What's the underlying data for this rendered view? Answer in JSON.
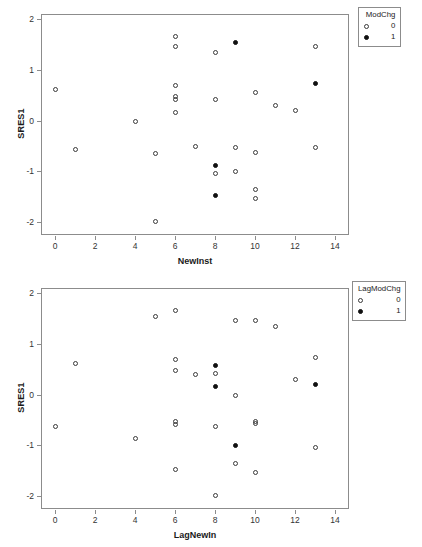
{
  "chart_data": [
    {
      "type": "scatter",
      "title": "",
      "xlabel": "NewInst",
      "ylabel": "SRES1",
      "xlim": [
        -0.7,
        14.7
      ],
      "ylim": [
        -2.25,
        2.1
      ],
      "xticks": [
        0,
        2,
        4,
        6,
        8,
        10,
        12,
        14
      ],
      "yticks": [
        -2,
        -1,
        0,
        1,
        2
      ],
      "grid": false,
      "legend": {
        "title": "ModChg",
        "position": "top-right",
        "entries": [
          {
            "label": "0",
            "marker": "open-circle"
          },
          {
            "label": "1",
            "marker": "filled-circle"
          }
        ]
      },
      "series": [
        {
          "name": "0",
          "marker": "open-circle",
          "points": [
            {
              "x": 0,
              "y": 0.61
            },
            {
              "x": 1,
              "y": -0.56
            },
            {
              "x": 4,
              "y": -0.01
            },
            {
              "x": 5,
              "y": -0.64
            },
            {
              "x": 5,
              "y": -1.99
            },
            {
              "x": 6,
              "y": 1.66
            },
            {
              "x": 6,
              "y": 1.47
            },
            {
              "x": 6,
              "y": 0.69
            },
            {
              "x": 6,
              "y": 0.48
            },
            {
              "x": 6,
              "y": 0.42
            },
            {
              "x": 6,
              "y": 0.17
            },
            {
              "x": 7,
              "y": -0.51
            },
            {
              "x": 8,
              "y": 1.35
            },
            {
              "x": 8,
              "y": 0.42
            },
            {
              "x": 8,
              "y": -1.03
            },
            {
              "x": 9,
              "y": -0.53
            },
            {
              "x": 9,
              "y": -1.0
            },
            {
              "x": 10,
              "y": 0.56
            },
            {
              "x": 10,
              "y": -0.63
            },
            {
              "x": 10,
              "y": -1.35
            },
            {
              "x": 10,
              "y": -1.54
            },
            {
              "x": 11,
              "y": 0.29
            },
            {
              "x": 12,
              "y": 0.2
            },
            {
              "x": 13,
              "y": 1.46
            },
            {
              "x": 13,
              "y": -0.52
            }
          ]
        },
        {
          "name": "1",
          "marker": "filled-circle",
          "points": [
            {
              "x": 9,
              "y": 1.53
            },
            {
              "x": 13,
              "y": 0.73
            },
            {
              "x": 8,
              "y": -0.88
            },
            {
              "x": 8,
              "y": -1.48
            }
          ]
        }
      ]
    },
    {
      "type": "scatter",
      "title": "",
      "xlabel": "LagNewIn",
      "ylabel": "SRES1",
      "xlim": [
        -0.7,
        14.7
      ],
      "ylim": [
        -2.25,
        2.1
      ],
      "xticks": [
        0,
        2,
        4,
        6,
        8,
        10,
        12,
        14
      ],
      "yticks": [
        -2,
        -1,
        0,
        1,
        2
      ],
      "grid": false,
      "legend": {
        "title": "LagModChg",
        "position": "top-right",
        "entries": [
          {
            "label": "0",
            "marker": "open-circle"
          },
          {
            "label": "1",
            "marker": "filled-circle"
          }
        ]
      },
      "series": [
        {
          "name": "0",
          "marker": "open-circle",
          "points": [
            {
              "x": 0,
              "y": -0.62
            },
            {
              "x": 1,
              "y": 0.61
            },
            {
              "x": 4,
              "y": -0.87
            },
            {
              "x": 5,
              "y": 1.54
            },
            {
              "x": 6,
              "y": 1.66
            },
            {
              "x": 6,
              "y": 0.69
            },
            {
              "x": 6,
              "y": 0.47
            },
            {
              "x": 6,
              "y": -0.52
            },
            {
              "x": 6,
              "y": -0.58
            },
            {
              "x": 6,
              "y": -1.47
            },
            {
              "x": 7,
              "y": 0.4
            },
            {
              "x": 8,
              "y": 0.42
            },
            {
              "x": 8,
              "y": -0.62
            },
            {
              "x": 8,
              "y": -1.99
            },
            {
              "x": 9,
              "y": 1.47
            },
            {
              "x": 9,
              "y": -0.02
            },
            {
              "x": 9,
              "y": -1.35
            },
            {
              "x": 10,
              "y": 1.47
            },
            {
              "x": 10,
              "y": -0.52
            },
            {
              "x": 10,
              "y": -0.56
            },
            {
              "x": 10,
              "y": -1.54
            },
            {
              "x": 11,
              "y": 1.35
            },
            {
              "x": 12,
              "y": 0.29
            },
            {
              "x": 13,
              "y": 0.73
            },
            {
              "x": 13,
              "y": -1.03
            }
          ]
        },
        {
          "name": "1",
          "marker": "filled-circle",
          "points": [
            {
              "x": 8,
              "y": 0.58
            },
            {
              "x": 8,
              "y": 0.16
            },
            {
              "x": 9,
              "y": -1.0
            },
            {
              "x": 13,
              "y": 0.21
            }
          ]
        }
      ]
    }
  ],
  "colors": {
    "axis": "#8c8c8c",
    "marker_outline": "#3a3a3a",
    "marker_fill": "#111111",
    "text": "#1a1a1a",
    "background": "#ffffff"
  }
}
